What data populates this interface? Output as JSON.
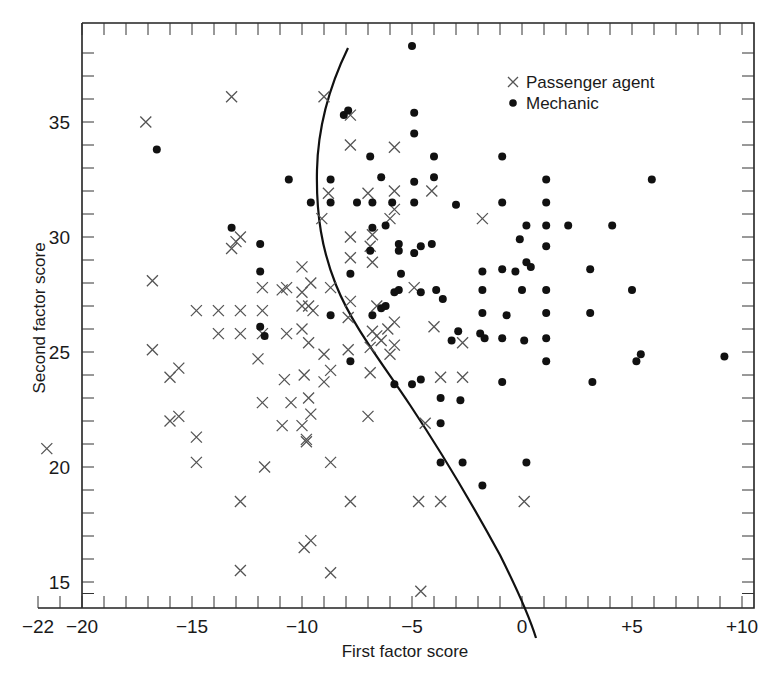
{
  "chart_data": {
    "type": "scatter",
    "title": "",
    "xlabel": "First factor score",
    "ylabel": "Second factor score",
    "xlim": [
      -22,
      11
    ],
    "ylim": [
      14,
      39
    ],
    "x_ticks": [
      {
        "value": -22,
        "label": "−22"
      },
      {
        "value": -20,
        "label": "−20"
      },
      {
        "value": -15,
        "label": "−15"
      },
      {
        "value": -10,
        "label": "−10"
      },
      {
        "value": -5,
        "label": "−5"
      },
      {
        "value": 0,
        "label": "0"
      },
      {
        "value": 5,
        "label": "+5"
      },
      {
        "value": 10,
        "label": "+10"
      }
    ],
    "y_ticks": [
      {
        "value": 15,
        "label": "15"
      },
      {
        "value": 20,
        "label": "20"
      },
      {
        "value": 25,
        "label": "25"
      },
      {
        "value": 30,
        "label": "30"
      },
      {
        "value": 35,
        "label": "35"
      }
    ],
    "grid": false,
    "legend_position": "upper right",
    "legend": [
      {
        "marker": "x",
        "label": "Passenger agent"
      },
      {
        "marker": "dot",
        "label": "Mechanic"
      }
    ],
    "series": [
      {
        "name": "Passenger agent",
        "marker": "x",
        "points": [
          [
            -21.6,
            20.8
          ],
          [
            -17.1,
            35
          ],
          [
            -16.8,
            28.1
          ],
          [
            -16.8,
            25.1
          ],
          [
            -16,
            23.9
          ],
          [
            -15.6,
            24.3
          ],
          [
            -16,
            22
          ],
          [
            -15.6,
            22.2
          ],
          [
            -14.8,
            21.3
          ],
          [
            -14.8,
            20.2
          ],
          [
            -13.2,
            36.1
          ],
          [
            -12.8,
            18.5
          ],
          [
            -12.8,
            15.5
          ],
          [
            -14.8,
            26.8
          ],
          [
            -13.8,
            26.8
          ],
          [
            -12.8,
            26.8
          ],
          [
            -13.8,
            25.8
          ],
          [
            -12.8,
            25.8
          ],
          [
            -11.8,
            25.8
          ],
          [
            -11.8,
            26.8
          ],
          [
            -13.2,
            29.5
          ],
          [
            -13,
            29.8
          ],
          [
            -12.8,
            30
          ],
          [
            -12,
            24.7
          ],
          [
            -11.8,
            27.8
          ],
          [
            -10.9,
            27.7
          ],
          [
            -11.8,
            22.8
          ],
          [
            -11.7,
            20
          ],
          [
            -10.9,
            21.8
          ],
          [
            -10.7,
            27.8
          ],
          [
            -10.7,
            25.8
          ],
          [
            -10.5,
            22.8
          ],
          [
            -10,
            26
          ],
          [
            -10,
            27
          ],
          [
            -9.7,
            23
          ],
          [
            -10,
            28.7
          ],
          [
            -10,
            27.6
          ],
          [
            -9.7,
            27
          ],
          [
            -9.6,
            28
          ],
          [
            -9.5,
            26.8
          ],
          [
            -10,
            21.8
          ],
          [
            -9.8,
            21.2
          ],
          [
            -9.6,
            22.3
          ],
          [
            -9,
            23.7
          ],
          [
            -8.7,
            24.2
          ],
          [
            -9.0,
            36.1
          ],
          [
            -8.8,
            31.9
          ],
          [
            -9.1,
            30.8
          ],
          [
            -9.9,
            24
          ],
          [
            -9.8,
            21.1
          ],
          [
            -9.7,
            25.4
          ],
          [
            -8.7,
            20.2
          ],
          [
            -7.8,
            35.3
          ],
          [
            -7.8,
            34
          ],
          [
            -7.8,
            30
          ],
          [
            -7.8,
            29.1
          ],
          [
            -7.8,
            27.2
          ],
          [
            -7.9,
            25.1
          ],
          [
            -6.9,
            24.1
          ],
          [
            -7,
            22.2
          ],
          [
            -7.0,
            31.9
          ],
          [
            -6.9,
            25.2
          ],
          [
            -6.8,
            25.9
          ],
          [
            -6.6,
            27
          ],
          [
            -6,
            24.9
          ],
          [
            -5.8,
            25.3
          ],
          [
            -5.8,
            26.3
          ],
          [
            -6,
            30.8
          ],
          [
            -8.7,
            15.4
          ],
          [
            -9.9,
            16.5
          ],
          [
            -9.6,
            16.8
          ],
          [
            -7.8,
            18.5
          ],
          [
            -6.8,
            30.1
          ],
          [
            -6.8,
            28.9
          ],
          [
            -5.8,
            33.9
          ],
          [
            -5.8,
            31.2
          ],
          [
            -5.8,
            32
          ],
          [
            -4.9,
            27.8
          ],
          [
            -4.7,
            18.5
          ],
          [
            -4.6,
            14.6
          ],
          [
            -4.4,
            21.9
          ],
          [
            -4.1,
            32
          ],
          [
            -3.7,
            23.9
          ],
          [
            -3.7,
            18.5
          ],
          [
            -2.7,
            23.9
          ],
          [
            -1.8,
            30.8
          ],
          [
            -4,
            26.1
          ],
          [
            -2.7,
            25.4
          ],
          [
            0.1,
            18.5
          ],
          [
            -6.9,
            29.6
          ],
          [
            -6.6,
            25.7
          ],
          [
            -6.4,
            25.5
          ],
          [
            -6.1,
            26
          ],
          [
            -9,
            24.9
          ],
          [
            -8.7,
            27.8
          ],
          [
            -7.9,
            26.5
          ],
          [
            -10.8,
            23.8
          ]
        ]
      },
      {
        "name": "Mechanic",
        "marker": "dot",
        "points": [
          [
            -16.6,
            33.8
          ],
          [
            -5,
            38.3
          ],
          [
            -4.9,
            35.4
          ],
          [
            -8.1,
            35.3
          ],
          [
            -7.9,
            35.5
          ],
          [
            -4.9,
            34.5
          ],
          [
            -6.9,
            33.5
          ],
          [
            -4,
            33.5
          ],
          [
            -4,
            32.6
          ],
          [
            -4.9,
            32.4
          ],
          [
            -4.9,
            31.5
          ],
          [
            -5.9,
            31.5
          ],
          [
            -3,
            31.4
          ],
          [
            -0.9,
            33.5
          ],
          [
            1.1,
            32.5
          ],
          [
            1.1,
            31.5
          ],
          [
            1.1,
            30.5
          ],
          [
            -0.9,
            31.5
          ],
          [
            0.2,
            30.5
          ],
          [
            2.1,
            30.5
          ],
          [
            4.1,
            30.5
          ],
          [
            5.9,
            32.5
          ],
          [
            -10.6,
            32.5
          ],
          [
            -9.6,
            31.5
          ],
          [
            -8.7,
            32.5
          ],
          [
            -8.7,
            31.5
          ],
          [
            -7.5,
            31.5
          ],
          [
            -6.8,
            31.5
          ],
          [
            -7.8,
            28.4
          ],
          [
            -6.9,
            29.4
          ],
          [
            -6.8,
            30.4
          ],
          [
            -6.4,
            32.6
          ],
          [
            -6.2,
            30.5
          ],
          [
            -5.6,
            29.7
          ],
          [
            -5.6,
            29.4
          ],
          [
            -5.5,
            28.4
          ],
          [
            -4.9,
            29.3
          ],
          [
            -4.6,
            29.6
          ],
          [
            -4.6,
            27.6
          ],
          [
            -4.1,
            29.7
          ],
          [
            -3.9,
            27.7
          ],
          [
            -3.6,
            27.3
          ],
          [
            -1.8,
            27.7
          ],
          [
            -1.8,
            28.5
          ],
          [
            -0.9,
            28.6
          ],
          [
            -0.3,
            28.5
          ],
          [
            0.2,
            28.9
          ],
          [
            0.4,
            28.7
          ],
          [
            1.1,
            27.7
          ],
          [
            0,
            27.7
          ],
          [
            3.1,
            28.6
          ],
          [
            -0.1,
            29.9
          ],
          [
            1.1,
            29.6
          ],
          [
            -1.8,
            26.7
          ],
          [
            -0.7,
            26.6
          ],
          [
            1.1,
            26.7
          ],
          [
            3.1,
            26.7
          ],
          [
            5,
            27.7
          ],
          [
            -6.8,
            26.6
          ],
          [
            -6.4,
            26.9
          ],
          [
            -6.2,
            27
          ],
          [
            -5.8,
            27.6
          ],
          [
            -5.6,
            27.7
          ],
          [
            -11.9,
            29.7
          ],
          [
            -11.9,
            28.5
          ],
          [
            -13.2,
            30.4
          ],
          [
            -11.9,
            26.1
          ],
          [
            -11.7,
            25.7
          ],
          [
            -8.7,
            26.6
          ],
          [
            -7.8,
            24.6
          ],
          [
            -5.8,
            23.6
          ],
          [
            -5,
            23.6
          ],
          [
            -4.6,
            23.8
          ],
          [
            -3.7,
            23
          ],
          [
            -2.8,
            22.9
          ],
          [
            -2.9,
            25.9
          ],
          [
            -1.9,
            25.8
          ],
          [
            -1.7,
            25.6
          ],
          [
            -3.2,
            25.5
          ],
          [
            -0.9,
            25.6
          ],
          [
            0.1,
            25.5
          ],
          [
            1.1,
            25.6
          ],
          [
            1.1,
            24.6
          ],
          [
            3.2,
            23.7
          ],
          [
            5.2,
            24.6
          ],
          [
            5.4,
            24.9
          ],
          [
            9.2,
            24.8
          ],
          [
            -3.7,
            20.2
          ],
          [
            -2.7,
            20.2
          ],
          [
            -1.8,
            19.2
          ],
          [
            0.2,
            20.2
          ],
          [
            -0.9,
            23.7
          ],
          [
            -3.7,
            21.9
          ]
        ]
      }
    ],
    "annotations": [
      {
        "type": "curve",
        "description": "Discriminant boundary curve separating passenger agents (left) from mechanics (right)"
      }
    ],
    "calibration": {
      "x_px_per_unit": 22,
      "x_zero_px": 522,
      "y_px_per_unit": 23,
      "y_35_px": 122
    }
  },
  "legend": {
    "passenger_label": "Passenger agent",
    "mechanic_label": "Mechanic"
  },
  "axes": {
    "x_title": "First factor score",
    "y_title": "Second factor score"
  }
}
